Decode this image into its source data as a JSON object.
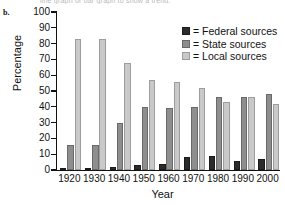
{
  "panel_letter": "b.",
  "cut_caption": "line graph or bar graph to show a trend.",
  "legend": {
    "position": "top-right",
    "entries": [
      {
        "key": "federal",
        "label": "= Federal sources",
        "color": "#2b2b2b",
        "name": "Federal sources"
      },
      {
        "key": "state",
        "label": "= State sources",
        "color": "#8e8e8e",
        "name": "State sources"
      },
      {
        "key": "local",
        "label": "= Local sources",
        "color": "#c9c9c9",
        "name": "Local sources"
      }
    ]
  },
  "chart_data": {
    "type": "bar",
    "title": "",
    "xlabel": "Year",
    "ylabel": "Percentage",
    "categories": [
      "1920",
      "1930",
      "1940",
      "1950",
      "1960",
      "1970",
      "1980",
      "1990",
      "2000"
    ],
    "series": [
      {
        "name": "Federal sources",
        "color": "#2b2b2b",
        "values": [
          0.5,
          1,
          2,
          3,
          4,
          8,
          9,
          6,
          7
        ]
      },
      {
        "name": "State sources",
        "color": "#8e8e8e",
        "values": [
          16,
          16,
          30,
          40,
          39,
          40,
          46,
          46,
          48
        ]
      },
      {
        "name": "Local sources",
        "color": "#c9c9c9",
        "values": [
          83,
          83,
          68,
          57,
          56,
          52,
          43,
          46,
          42
        ]
      }
    ],
    "ylim": [
      0,
      100
    ],
    "ytick_values": [
      0,
      10,
      20,
      30,
      40,
      50,
      60,
      70,
      80,
      90,
      100
    ],
    "ytick_labels": [
      "0",
      "10",
      "20",
      "30",
      "40",
      "50",
      "60",
      "70",
      "80",
      "90",
      "100"
    ],
    "grid": false,
    "legend_position": "top-right"
  }
}
